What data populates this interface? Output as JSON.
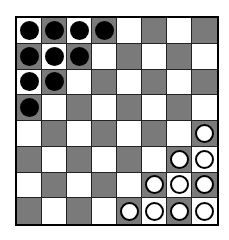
{
  "board": {
    "size": 8,
    "light_color": "#ffffff",
    "dark_color": "#9a9a9a",
    "pieces": {
      "black": [
        [
          0,
          0
        ],
        [
          0,
          1
        ],
        [
          0,
          2
        ],
        [
          0,
          3
        ],
        [
          1,
          0
        ],
        [
          1,
          1
        ],
        [
          1,
          2
        ],
        [
          2,
          0
        ],
        [
          2,
          1
        ],
        [
          3,
          0
        ]
      ],
      "white": [
        [
          4,
          7
        ],
        [
          5,
          6
        ],
        [
          5,
          7
        ],
        [
          6,
          5
        ],
        [
          6,
          6
        ],
        [
          6,
          7
        ],
        [
          7,
          4
        ],
        [
          7,
          5
        ],
        [
          7,
          6
        ],
        [
          7,
          7
        ]
      ]
    }
  }
}
